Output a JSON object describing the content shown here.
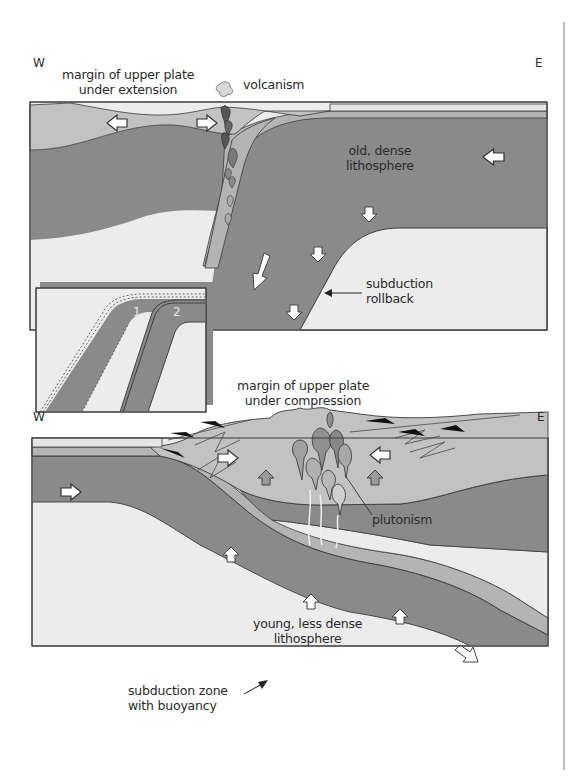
{
  "figure": {
    "colors": {
      "dense_lithosphere": "#8a8a8a",
      "crust_band": "#b4b4b4",
      "upper_plate": "#c2c2c2",
      "asthenosphere": "#ececec",
      "outline": "#3a3a3a",
      "arrow_fill": "#ffffff",
      "up_arrow_fill": "#9a9a9a",
      "thrust_black": "#111111"
    },
    "panels": [
      {
        "id": "top",
        "west_label": "W",
        "east_label": "E",
        "labels": {
          "upper_margin": [
            "margin of upper plate",
            "under extension"
          ],
          "volcanism": "volcanism",
          "lithosphere": [
            "old, dense",
            "lithosphere"
          ],
          "rollback": [
            "subduction",
            "rollback"
          ]
        },
        "inset": {
          "slab_labels": [
            "1",
            "2"
          ]
        }
      },
      {
        "id": "bottom",
        "west_label": "W",
        "east_label": "E",
        "labels": {
          "upper_margin": [
            "margin of upper plate",
            "under compression"
          ],
          "plutonism": "plutonism",
          "lithosphere": [
            "young, less dense",
            "lithosphere"
          ],
          "buoyancy": [
            "subduction zone",
            "with buoyancy"
          ]
        }
      }
    ]
  }
}
